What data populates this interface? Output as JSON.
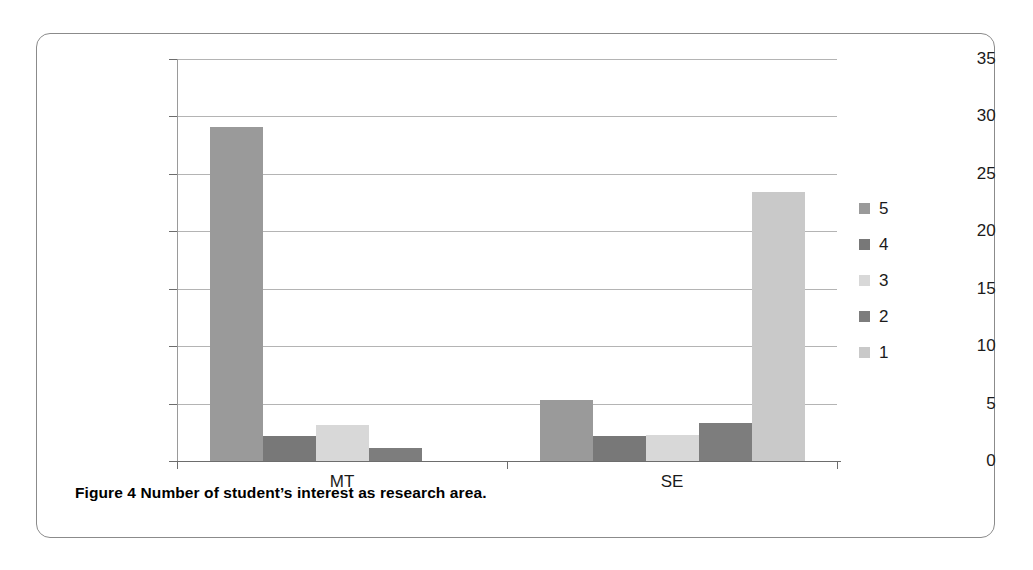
{
  "caption": {
    "label": "Figure 4",
    "text": "Number of student’s interest as research area."
  },
  "chart_data": {
    "type": "bar",
    "title": "",
    "xlabel": "",
    "ylabel": "",
    "categories": [
      "MT",
      "SE"
    ],
    "ylim": [
      0,
      35
    ],
    "yticks": [
      0,
      5,
      10,
      15,
      20,
      25,
      30,
      35
    ],
    "ytick_labels": [
      "0",
      "5",
      "10",
      "15",
      "20",
      "25",
      "30",
      "35"
    ],
    "grid": true,
    "legend_position": "right",
    "series": [
      {
        "name": "5",
        "values": [
          29.1,
          5.3
        ],
        "color": "#9a9a9a"
      },
      {
        "name": "4",
        "values": [
          2.2,
          2.2
        ],
        "color": "#787878"
      },
      {
        "name": "3",
        "values": [
          3.1,
          2.3
        ],
        "color": "#d8d8d8"
      },
      {
        "name": "2",
        "values": [
          1.1,
          3.3
        ],
        "color": "#7d7d7d"
      },
      {
        "name": "1",
        "values": [
          0,
          23.4
        ],
        "color": "#c9c9c9"
      }
    ]
  }
}
